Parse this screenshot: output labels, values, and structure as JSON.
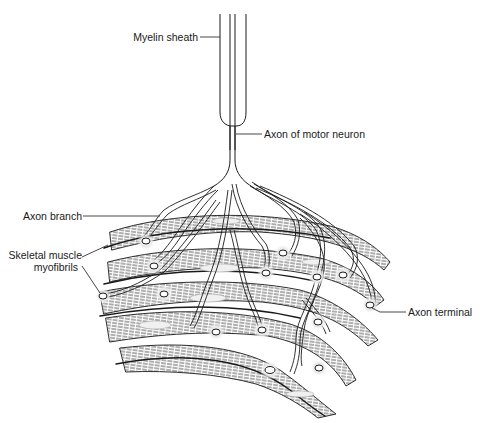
{
  "diagram": {
    "labels": {
      "myelin_sheath": "Myelin sheath",
      "axon_of_motor_neuron": "Axon of motor neuron",
      "axon_branch": "Axon branch",
      "skeletal_muscle_line1": "Skeletal muscle",
      "skeletal_muscle_line2": "myofibrils",
      "axon_terminal": "Axon terminal"
    },
    "colors": {
      "ink": "#1a1a1a",
      "stipple": "#9a9a9a",
      "background": "#ffffff"
    }
  }
}
